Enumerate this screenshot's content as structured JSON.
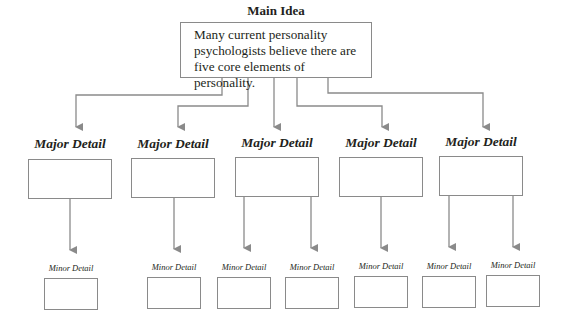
{
  "diagram": {
    "main_idea": {
      "title": "Main Idea",
      "text": "Many current personality psychologists believe there are five core elements of personality."
    },
    "major_details": [
      {
        "label": "Major Detail",
        "content": "",
        "minor_count": 1
      },
      {
        "label": "Major Detail",
        "content": "",
        "minor_count": 1
      },
      {
        "label": "Major Detail",
        "content": "",
        "minor_count": 2
      },
      {
        "label": "Major Detail",
        "content": "",
        "minor_count": 1
      },
      {
        "label": "Major Detail",
        "content": "",
        "minor_count": 2
      }
    ],
    "minor_details": [
      {
        "label": "Minor Detail",
        "content": "",
        "parent": 0
      },
      {
        "label": "Minor Detail",
        "content": "",
        "parent": 1
      },
      {
        "label": "Minor Detail",
        "content": "",
        "parent": 2
      },
      {
        "label": "Minor Detail",
        "content": "",
        "parent": 2
      },
      {
        "label": "Minor Detail",
        "content": "",
        "parent": 3
      },
      {
        "label": "Minor Detail",
        "content": "",
        "parent": 4
      },
      {
        "label": "Minor Detail",
        "content": "",
        "parent": 4
      }
    ],
    "colors": {
      "line": "#8a8a8a",
      "text": "#231f20",
      "background": "#ffffff"
    }
  }
}
